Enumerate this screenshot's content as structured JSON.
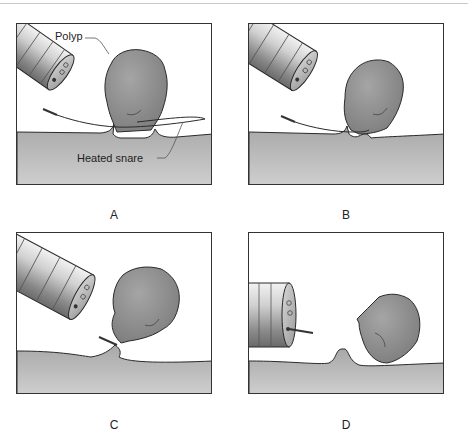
{
  "figure": {
    "panels": [
      {
        "id": "A",
        "caption": "A",
        "state": "snare-looped-around-polyp-stalk"
      },
      {
        "id": "B",
        "caption": "B",
        "state": "snare-tightened"
      },
      {
        "id": "C",
        "caption": "C",
        "state": "stalk-constricted"
      },
      {
        "id": "D",
        "caption": "D",
        "state": "polyp-severed"
      }
    ],
    "labels": {
      "polyp": "Polyp",
      "heated_snare": "Heated snare"
    },
    "colors": {
      "tissue": "#b4b4b4",
      "polyp": "#8e8e8e",
      "scope_light": "#e6e6e6",
      "scope_dark": "#7a7a7a",
      "outline": "#2a2a2a"
    }
  }
}
